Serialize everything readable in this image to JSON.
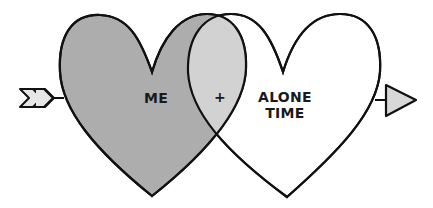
{
  "diagram": {
    "type": "venn-hearts",
    "sets": [
      {
        "id": "left",
        "label": "ME",
        "fill": "#adadad"
      },
      {
        "id": "right",
        "label_lines": [
          "ALONE",
          "TIME"
        ],
        "fill": "#ffffff"
      }
    ],
    "intersection": {
      "label": "+",
      "fill": "#d2d2d2"
    },
    "arrow": {
      "fletching_fill": "#e6e6e6",
      "head_fill": "#d8d8d8"
    },
    "stroke_color": "#111111"
  }
}
